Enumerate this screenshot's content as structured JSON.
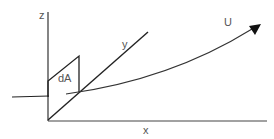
{
  "diagram": {
    "labels": {
      "z": "z",
      "y": "y",
      "x": "x",
      "U": "U",
      "dA": "dA"
    },
    "colors": {
      "line": "#222222",
      "axis": "#333333",
      "text": "#555555",
      "background": "#ffffff"
    },
    "elements": {
      "z_axis": "vertical axis",
      "x_axis": "horizontal axis",
      "y_axis": "oblique axis",
      "area_element": "parallelogram dA",
      "flow_vector": "curved arrow U",
      "incoming_line": "horizontal line from left"
    }
  }
}
